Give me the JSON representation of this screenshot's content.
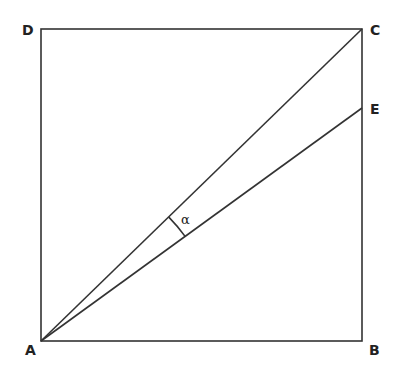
{
  "figure": {
    "points": {
      "A": {
        "label": "A",
        "x": 41,
        "y": 341
      },
      "B": {
        "label": "B",
        "x": 362,
        "y": 341
      },
      "C": {
        "label": "C",
        "x": 362,
        "y": 29
      },
      "D": {
        "label": "D",
        "x": 41,
        "y": 29
      },
      "E": {
        "label": "E",
        "x": 362,
        "y": 108
      }
    },
    "segments": [
      "AB",
      "BC",
      "CD",
      "DA",
      "AC",
      "AE"
    ],
    "angle": {
      "label": "α",
      "vertex": "A",
      "between": [
        "AC",
        "AE"
      ]
    },
    "stroke_color": "#333333"
  }
}
